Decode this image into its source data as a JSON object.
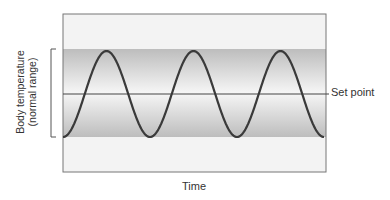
{
  "diagram": {
    "y_axis_label_line1": "Body temperature",
    "y_axis_label_line2": "(normal range)",
    "x_axis_label": "Time",
    "reference_line_label": "Set point",
    "colors": {
      "frame": "#777777",
      "background": "#f3f3f3",
      "band_edge": "#bdbdbd",
      "band_center": "#f5f5f5",
      "curve": "#3a3a3a",
      "set_point_line": "#444444"
    },
    "curve": {
      "shape": "sine",
      "cycles": 3,
      "starts_at": "trough",
      "ends_at": "trough"
    }
  }
}
